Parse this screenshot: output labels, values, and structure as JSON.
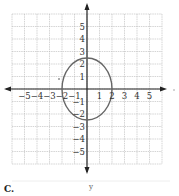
{
  "figure": {
    "type": "coordinate-plane-graph",
    "curve": "ellipse",
    "ellipse": {
      "center": [
        0,
        0
      ],
      "rx": 2,
      "ry": 2.5
    },
    "x_range": [
      -6,
      6
    ],
    "y_range": [
      -6,
      6
    ],
    "x_tick_labels": [
      "−5",
      "−4",
      "−3",
      "−2",
      "−1",
      "1",
      "2",
      "3",
      "4",
      "5"
    ],
    "y_tick_labels_positive": [
      "5",
      "4",
      "3",
      "2",
      "1"
    ],
    "y_tick_labels_negative": [
      "−1",
      "−2",
      "−3",
      "−4",
      "−5"
    ],
    "colors": {
      "grid": "#b8b8b8",
      "axis": "#222222",
      "curve": "#666666"
    }
  },
  "captions": {
    "option_letter": "C.",
    "axis_label": "y"
  }
}
